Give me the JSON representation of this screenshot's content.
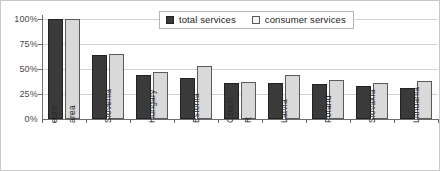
{
  "chart_data": {
    "type": "bar",
    "title": "",
    "xlabel": "",
    "ylabel": "",
    "ylim": [
      0,
      100
    ],
    "grid": true,
    "legend_position": "top-center",
    "ytick_labels": [
      "100%",
      "75%",
      "50%",
      "25%",
      "0%"
    ],
    "ytick_values": [
      100,
      75,
      50,
      25,
      0
    ],
    "categories": [
      "euro area",
      "Slovenia",
      "Hungary",
      "Estonia",
      "Czech R",
      "Latvia",
      "Poland",
      "Slovakia",
      "Lithuania"
    ],
    "category_label_parts": [
      [
        "euro",
        "area"
      ],
      [
        "Slovenia",
        ""
      ],
      [
        "Hungary",
        ""
      ],
      [
        "Estonia",
        ""
      ],
      [
        "Czech",
        "R"
      ],
      [
        "Latvia",
        ""
      ],
      [
        "Poland",
        ""
      ],
      [
        "Slovakia",
        ""
      ],
      [
        "Lithuania",
        ""
      ]
    ],
    "series": [
      {
        "name": "total services",
        "color": "#3a3a3a",
        "values": [
          100,
          64,
          44,
          41,
          36,
          36,
          35,
          33,
          31
        ]
      },
      {
        "name": "consumer services",
        "color": "#d9d9d9",
        "values": [
          100,
          65,
          47,
          53,
          37,
          44,
          39,
          36,
          38
        ]
      }
    ]
  },
  "legend": {
    "items": [
      {
        "label": "total services",
        "swatch": "total-services-swatch"
      },
      {
        "label": "consumer services",
        "swatch": "consumer-services-swatch"
      }
    ]
  }
}
